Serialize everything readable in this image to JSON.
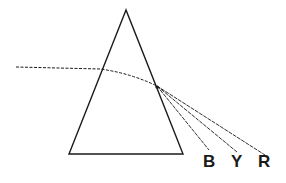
{
  "diagram": {
    "title": "",
    "type": "prism dispersion",
    "labels": {
      "blue": "B",
      "yellow": "Y",
      "red": "R"
    },
    "colors": {
      "stroke": "#1a1a1a",
      "background": "#ffffff"
    }
  }
}
